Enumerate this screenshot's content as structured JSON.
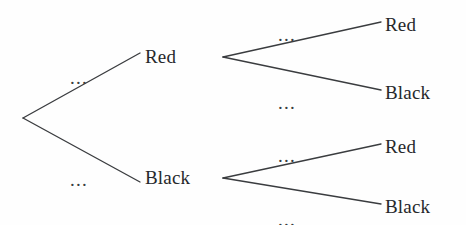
{
  "diagram": {
    "type": "probability-tree",
    "background_color": "#fefefe",
    "line_color": "#3a3c3f",
    "text_color": "#26282b",
    "width": 466,
    "height": 225,
    "root": {
      "x": 23,
      "y": 118
    },
    "nodes": [
      {
        "id": "level1-red",
        "label": "Red",
        "level": 1,
        "x": 145,
        "y": 57,
        "vertex_x": 223,
        "vertex_y": 57
      },
      {
        "id": "level1-black",
        "label": "Black",
        "level": 1,
        "x": 145,
        "y": 178,
        "vertex_x": 223,
        "vertex_y": 178
      },
      {
        "id": "level2-red-red",
        "label": "Red",
        "level": 2,
        "x": 385,
        "y": 25
      },
      {
        "id": "level2-red-black",
        "label": "Black",
        "level": 2,
        "x": 385,
        "y": 93
      },
      {
        "id": "level2-black-red",
        "label": "Red",
        "level": 2,
        "x": 385,
        "y": 147
      },
      {
        "id": "level2-black-black",
        "label": "Black",
        "level": 2,
        "x": 385,
        "y": 207
      }
    ],
    "branches": [
      {
        "id": "branch-root-red",
        "from_x": 23,
        "from_y": 118,
        "to_x": 140,
        "to_y": 53,
        "label": "...",
        "label_x": 70,
        "label_y": 68
      },
      {
        "id": "branch-root-black",
        "from_x": 23,
        "from_y": 118,
        "to_x": 140,
        "to_y": 182,
        "label": "...",
        "label_x": 70,
        "label_y": 170
      },
      {
        "id": "branch-red-red",
        "from_x": 223,
        "from_y": 57,
        "to_x": 381,
        "to_y": 22,
        "label": "...",
        "label_x": 278,
        "label_y": 25
      },
      {
        "id": "branch-red-black",
        "from_x": 223,
        "from_y": 57,
        "to_x": 381,
        "to_y": 90,
        "label": "...",
        "label_x": 278,
        "label_y": 93
      },
      {
        "id": "branch-black-red",
        "from_x": 223,
        "from_y": 178,
        "to_x": 381,
        "to_y": 144,
        "label": "...",
        "label_x": 278,
        "label_y": 146
      },
      {
        "id": "branch-black-black",
        "from_x": 223,
        "from_y": 178,
        "to_x": 381,
        "to_y": 204,
        "label": "...",
        "label_x": 278,
        "label_y": 210
      }
    ]
  }
}
